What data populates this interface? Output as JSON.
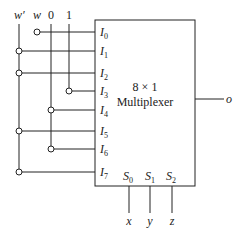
{
  "diagram": {
    "type": "circuit",
    "component": {
      "title_line1": "8 × 1",
      "title_line2": "Multiplexer"
    },
    "source_labels": {
      "w_prime": "w′",
      "w": "w",
      "zero": "0",
      "one": "1"
    },
    "inputs": [
      {
        "label": "I",
        "sub": "0",
        "source": "w"
      },
      {
        "label": "I",
        "sub": "1",
        "source": "w′"
      },
      {
        "label": "I",
        "sub": "2",
        "source": "w′"
      },
      {
        "label": "I",
        "sub": "3",
        "source": "1"
      },
      {
        "label": "I",
        "sub": "4",
        "source": "0"
      },
      {
        "label": "I",
        "sub": "5",
        "source": "w′"
      },
      {
        "label": "I",
        "sub": "6",
        "source": "0"
      },
      {
        "label": "I",
        "sub": "7",
        "source": "w′"
      }
    ],
    "selects": [
      {
        "label": "S",
        "sub": "0",
        "signal": "x"
      },
      {
        "label": "S",
        "sub": "1",
        "signal": "y"
      },
      {
        "label": "S",
        "sub": "2",
        "signal": "z"
      }
    ],
    "output": {
      "label": "o"
    },
    "colors": {
      "line": "#222222",
      "background": "#ffffff"
    }
  }
}
